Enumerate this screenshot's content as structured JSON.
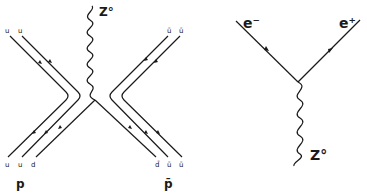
{
  "left_diagram": {
    "boson_label": "Z°",
    "top_left_labels": [
      "u",
      "u"
    ],
    "top_right_labels": [
      "ū",
      "ū"
    ],
    "bottom_left_labels": [
      "u",
      "u",
      "d"
    ],
    "bottom_right_labels": [
      "d̄",
      "ū",
      "ū"
    ],
    "proton_label": "p",
    "antiproton_label": "p̄"
  },
  "right_diagram": {
    "electron_label": "e⁻",
    "positron_label": "e⁺",
    "boson_label": "Z°"
  },
  "colors": {
    "line": "#1a1a1a",
    "background": "#ffffff"
  }
}
